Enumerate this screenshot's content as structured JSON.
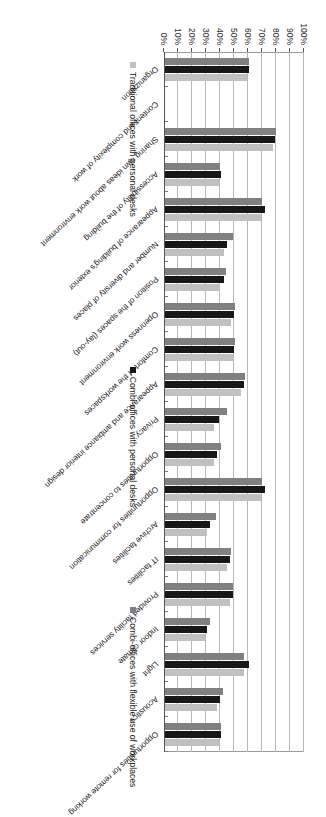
{
  "chart_data": {
    "type": "bar",
    "title": "",
    "xlabel": "",
    "ylabel": "",
    "orientation": "vertical-rotated",
    "grid": true,
    "legend_position": "right",
    "ylim": [
      0,
      100
    ],
    "yticks": [
      "0%",
      "10%",
      "20%",
      "30%",
      "40%",
      "50%",
      "60%",
      "70%",
      "80%",
      "90%",
      "100%"
    ],
    "ytick_values": [
      0,
      10,
      20,
      30,
      40,
      50,
      60,
      70,
      80,
      90,
      100
    ],
    "categories": [
      "Organization",
      "Content and complexity of work",
      "Sharing own ideas about work environment",
      "Accessibility of the building",
      "Appearance of building's exterior",
      "Number and diversity of places",
      "Position of the spaces (lay-out)",
      "Openness work environment",
      "Comfort of the workspaces",
      "Appearance and ambiance interior design",
      "Privacy",
      "Opportunities to concentrate",
      "Opportunities for communication",
      "Archive facilities",
      "IT facilities",
      "Provided facility services",
      "Indoor climate",
      "Light",
      "Acoustics",
      "Opportunities for remote working"
    ],
    "series": [
      {
        "name": "Traditional offices with personal desks",
        "color": "#c0c0c0",
        "values": [
          61,
          0,
          80,
          40,
          70,
          49,
          44,
          51,
          51,
          58,
          45,
          41,
          70,
          37,
          48,
          49,
          33,
          57,
          42,
          41
        ]
      },
      {
        "name": "Combi-offices with personal desks",
        "color": "#171717",
        "values": [
          61,
          0,
          79,
          41,
          72,
          45,
          43,
          50,
          50,
          57,
          39,
          38,
          72,
          33,
          47,
          49,
          31,
          61,
          40,
          41
        ]
      },
      {
        "name": "Combi-offices with flexible use of workplaces",
        "color": "#808080",
        "values": [
          59,
          0,
          78,
          39,
          69,
          43,
          40,
          48,
          49,
          55,
          36,
          36,
          69,
          31,
          45,
          47,
          29,
          57,
          38,
          39
        ]
      }
    ]
  },
  "legend": {
    "items": [
      {
        "label": "Traditional offices with personal desks",
        "swatch": "light-gray-swatch"
      },
      {
        "label": "Combi-offices with personal desks",
        "swatch": "black-swatch"
      },
      {
        "label": "Combi-offices with flexible use of workplaces",
        "swatch": "gray-swatch"
      }
    ]
  }
}
